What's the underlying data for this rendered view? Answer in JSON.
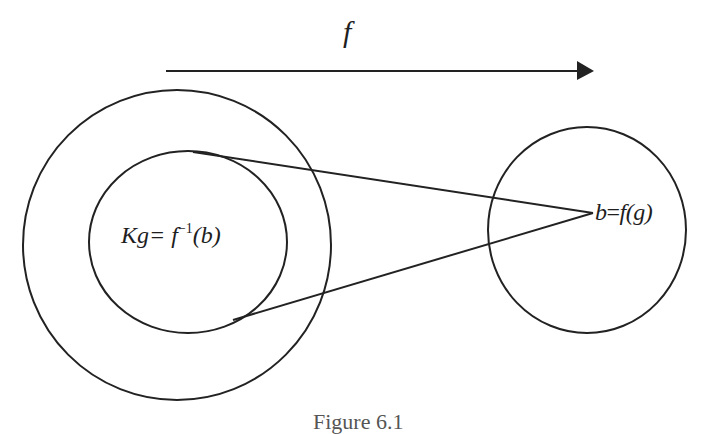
{
  "diagram": {
    "arrow": {
      "label": "f",
      "from": [
        166,
        71
      ],
      "to": [
        594,
        71
      ]
    },
    "domain_circle": {
      "shape": "circle",
      "center": [
        177,
        245
      ],
      "rx": 154,
      "ry": 155
    },
    "fiber_ellipse": {
      "shape": "ellipse",
      "center": [
        188,
        242
      ],
      "rx": 99,
      "ry": 91,
      "label_main": "Kg= ",
      "label_f": "f",
      "label_exp": "−1",
      "label_arg": "(b)"
    },
    "codomain_circle": {
      "shape": "circle",
      "center": [
        587,
        230
      ],
      "rx": 99,
      "ry": 103,
      "label_b": "b",
      "label_eq": "=",
      "label_f": "f",
      "label_arg": "(g)"
    },
    "projection_lines": [
      {
        "from": [
          193,
          152
        ],
        "to": [
          593,
          213
        ]
      },
      {
        "from": [
          233,
          320
        ],
        "to": [
          593,
          213
        ]
      }
    ],
    "caption": "Figure 6.1"
  }
}
